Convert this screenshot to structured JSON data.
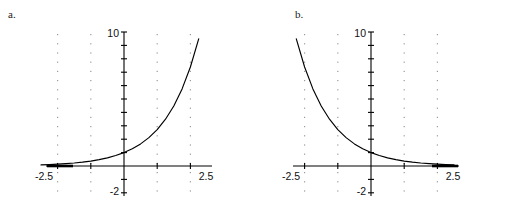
{
  "figure": {
    "background": "#ffffff",
    "curve_color": "#000000",
    "axis_color": "#000000",
    "grid_color": "#9a9a9a"
  },
  "panels": [
    {
      "label": "a.",
      "name": "panel-a",
      "chart_data": {
        "type": "line",
        "title": "",
        "xlabel": "",
        "ylabel": "",
        "xlim": [
          -2.5,
          2.5
        ],
        "ylim": [
          -2,
          10
        ],
        "grid": true,
        "grid_style": "dotted-vertical",
        "grid_x": [
          -2,
          -1,
          1,
          2
        ],
        "x_ticks": [
          -2,
          -1,
          1,
          2
        ],
        "y_ticks": [
          -2,
          -1,
          1,
          2,
          3,
          4,
          5,
          6,
          7,
          8,
          9,
          10
        ],
        "x_tick_labels": [
          "-2.5",
          "2.5"
        ],
        "y_tick_labels": [
          "10",
          "-2"
        ],
        "x_tick_label_values": [
          -2.5,
          2.5
        ],
        "y_tick_label_values": [
          10,
          -2
        ],
        "series": [
          {
            "name": "exponential-growth",
            "expression": "y = e^x",
            "x": [
              -2.5,
              -2.25,
              -2,
              -1.75,
              -1.5,
              -1.25,
              -1,
              -0.75,
              -0.5,
              -0.25,
              0,
              0.25,
              0.5,
              0.75,
              1,
              1.25,
              1.5,
              1.75,
              2,
              2.25
            ],
            "values": [
              0.082,
              0.105,
              0.135,
              0.174,
              0.223,
              0.287,
              0.368,
              0.472,
              0.607,
              0.779,
              1.0,
              1.284,
              1.649,
              2.117,
              2.718,
              3.49,
              4.482,
              5.755,
              7.389,
              9.488
            ]
          }
        ],
        "asymptote": {
          "name": "horizontal-asymptote",
          "y": 0,
          "x_from": -2.5,
          "x_to": -2.1
        }
      }
    },
    {
      "label": "b.",
      "name": "panel-b",
      "chart_data": {
        "type": "line",
        "title": "",
        "xlabel": "",
        "ylabel": "",
        "xlim": [
          -2.5,
          2.5
        ],
        "ylim": [
          -2,
          10
        ],
        "grid": true,
        "grid_style": "dotted-vertical",
        "grid_x": [
          -2,
          -1,
          1,
          2
        ],
        "x_ticks": [
          -2,
          -1,
          1,
          2
        ],
        "y_ticks": [
          -2,
          -1,
          1,
          2,
          3,
          4,
          5,
          6,
          7,
          8,
          9,
          10
        ],
        "x_tick_labels": [
          "-2.5",
          "2.5"
        ],
        "y_tick_labels": [
          "10",
          "-2"
        ],
        "x_tick_label_values": [
          -2.5,
          2.5
        ],
        "y_tick_label_values": [
          10,
          -2
        ],
        "series": [
          {
            "name": "exponential-decay",
            "expression": "y = e^-x",
            "x": [
              -2.25,
              -2,
              -1.75,
              -1.5,
              -1.25,
              -1,
              -0.75,
              -0.5,
              -0.25,
              0,
              0.25,
              0.5,
              0.75,
              1,
              1.25,
              1.5,
              1.75,
              2,
              2.25,
              2.5
            ],
            "values": [
              9.488,
              7.389,
              5.755,
              4.482,
              3.49,
              2.718,
              2.117,
              1.649,
              1.284,
              1.0,
              0.779,
              0.607,
              0.472,
              0.368,
              0.287,
              0.223,
              0.174,
              0.135,
              0.105,
              0.082
            ]
          }
        ],
        "asymptote": {
          "name": "horizontal-asymptote",
          "y": 0,
          "x_from": 2.1,
          "x_to": 2.5
        }
      }
    }
  ]
}
